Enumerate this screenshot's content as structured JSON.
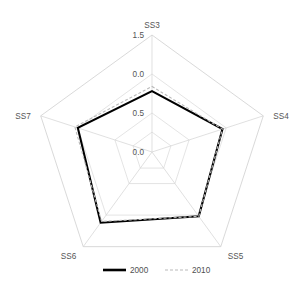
{
  "chart_data": {
    "type": "radar",
    "title": "",
    "categories": [
      "SS3",
      "SS4",
      "SS5",
      "SS6",
      "SS7"
    ],
    "series": [
      {
        "name": "2000",
        "style": "solid",
        "color": "#000000",
        "values": [
          0.78,
          0.95,
          1.02,
          1.12,
          1.0
        ]
      },
      {
        "name": "2010",
        "style": "dashed",
        "color": "#b9b9b9",
        "values": [
          0.84,
          0.95,
          1.02,
          1.1,
          1.04
        ]
      }
    ],
    "rlim": [
      0.0,
      1.5
    ],
    "tick_labels": [
      "0.0",
      "0.5",
      "0.0",
      "1.5"
    ],
    "tick_values": [
      0.0,
      0.5,
      1.0,
      1.5
    ],
    "grid": true,
    "legend_position": "bottom",
    "xlabel": "",
    "ylabel": ""
  },
  "axes": {
    "labels": [
      {
        "name": "SS3",
        "angle_deg": 90
      },
      {
        "name": "SS4",
        "angle_deg": 18
      },
      {
        "name": "SS5",
        "angle_deg": -54
      },
      {
        "name": "SS6",
        "angle_deg": -126
      },
      {
        "name": "SS7",
        "angle_deg": 162
      }
    ]
  },
  "radial_ticks": [
    {
      "label": "1.5",
      "value": 1.5
    },
    {
      "label": "0.0",
      "value": 1.0
    },
    {
      "label": "0.5",
      "value": 0.5
    },
    {
      "label": "0.0",
      "value": 0.0
    }
  ],
  "legend": {
    "entries": [
      {
        "label": "2000",
        "style": "solid"
      },
      {
        "label": "2010",
        "style": "dashed"
      }
    ]
  }
}
